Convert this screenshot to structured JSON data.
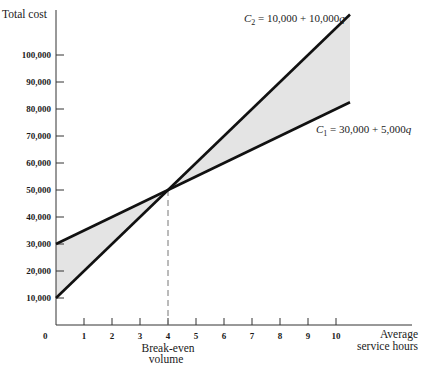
{
  "chart_data": {
    "type": "line",
    "title": "",
    "ylabel": "Total cost",
    "xlabel": "Average service hours",
    "xlabel_lines": [
      "Average",
      "service hours"
    ],
    "origin_label": "0",
    "xlim": [
      0,
      10.5
    ],
    "ylim": [
      0,
      115000
    ],
    "x_ticks": [
      1,
      2,
      3,
      4,
      5,
      6,
      7,
      8,
      9,
      10
    ],
    "y_ticks": [
      10000,
      20000,
      30000,
      40000,
      50000,
      60000,
      70000,
      80000,
      90000,
      100000
    ],
    "y_tick_labels": [
      "10,000",
      "20,000",
      "30,000",
      "40,000",
      "50,000",
      "60,000",
      "70,000",
      "80,000",
      "90,000",
      "100,000"
    ],
    "grid": false,
    "series": [
      {
        "name": "C1",
        "label": "C1 = 30,000 + 5,000q",
        "label_parts": {
          "var": "C",
          "sub": "1",
          "rest": " = 30,000 + 5,000",
          "q": "q"
        },
        "intercept": 30000,
        "slope": 5000,
        "x": [
          0,
          10.5
        ],
        "y": [
          30000,
          82500
        ]
      },
      {
        "name": "C2",
        "label": "C2 = 10,000 + 10,000q",
        "label_parts": {
          "var": "C",
          "sub": "2",
          "rest": " = 10,000 + 10,000",
          "q": "q"
        },
        "intercept": 10000,
        "slope": 10000,
        "x": [
          0,
          10.5
        ],
        "y": [
          10000,
          115000
        ]
      }
    ],
    "shaded_region": "area between C1 and C2",
    "annotations": [
      {
        "text": "Break-even volume",
        "lines": [
          "Break-even",
          "volume"
        ],
        "x": 4,
        "y": 50000,
        "style": "dashed vertical line"
      }
    ],
    "break_even": {
      "q": 4,
      "cost": 50000
    }
  },
  "colors": {
    "line": "#111111",
    "shade": "#e4e4e4",
    "axis": "#333333",
    "dashed": "#777777"
  }
}
